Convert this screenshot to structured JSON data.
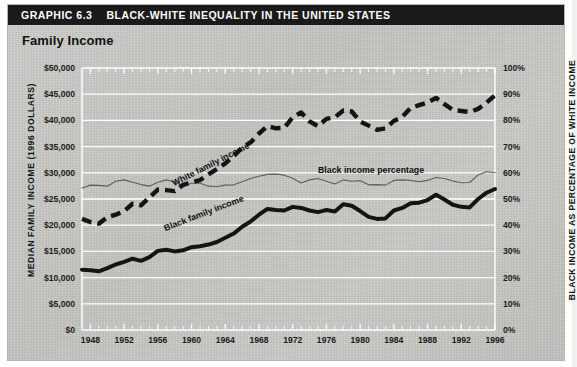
{
  "header": {
    "graphic_label": "GRAPHIC 6.3",
    "title": "BLACK-WHITE INEQUALITY IN THE UNITED STATES",
    "subtitle": "Family Income",
    "bar_color": "#1a1a1a",
    "panel_color": "#c9cac6"
  },
  "chart_data": {
    "type": "line",
    "title": "Family Income",
    "xlabel": "",
    "ylabel": "MEDIAN FAMILY INCOME (1996 DOLLARS)",
    "y2label": "BLACK INCOME AS PERCENTAGE OF WHITE INCOME",
    "xlim": [
      1947,
      1996
    ],
    "ylim": [
      0,
      50000
    ],
    "y2lim": [
      0,
      100
    ],
    "grid": true,
    "legend": "inline-labels",
    "y_ticks": [
      "$0",
      "$5,000",
      "$10,000",
      "$15,000",
      "$20,000",
      "$25,000",
      "$30,000",
      "$35,000",
      "$40,000",
      "$45,000",
      "$50,000"
    ],
    "y_tick_values": [
      0,
      5000,
      10000,
      15000,
      20000,
      25000,
      30000,
      35000,
      40000,
      45000,
      50000
    ],
    "y2_ticks": [
      "0%",
      "10%",
      "20%",
      "30%",
      "40%",
      "50%",
      "60%",
      "70%",
      "80%",
      "90%",
      "100%"
    ],
    "y2_tick_values": [
      0,
      10,
      20,
      30,
      40,
      50,
      60,
      70,
      80,
      90,
      100
    ],
    "x_ticks": [
      "1948",
      "1952",
      "1956",
      "1960",
      "1964",
      "1968",
      "1972",
      "1976",
      "1980",
      "1984",
      "1988",
      "1992",
      "1996"
    ],
    "x_tick_values": [
      1948,
      1952,
      1956,
      1960,
      1964,
      1968,
      1972,
      1976,
      1980,
      1984,
      1988,
      1992,
      1996
    ],
    "x": [
      1947,
      1948,
      1949,
      1950,
      1951,
      1952,
      1953,
      1954,
      1955,
      1956,
      1957,
      1958,
      1959,
      1960,
      1961,
      1962,
      1963,
      1964,
      1965,
      1966,
      1967,
      1968,
      1969,
      1970,
      1971,
      1972,
      1973,
      1974,
      1975,
      1976,
      1977,
      1978,
      1979,
      1980,
      1981,
      1982,
      1983,
      1984,
      1985,
      1986,
      1987,
      1988,
      1989,
      1990,
      1991,
      1992,
      1993,
      1994,
      1995,
      1996
    ],
    "series": [
      {
        "name": "White family income",
        "label": "White family income",
        "style": "dashed",
        "color": "#141414",
        "axis": "left",
        "values": [
          21200,
          20600,
          20300,
          21500,
          22000,
          22700,
          24100,
          23800,
          25300,
          26800,
          26700,
          26500,
          27700,
          28200,
          28600,
          29700,
          30700,
          31800,
          33200,
          34800,
          35800,
          37500,
          38900,
          38500,
          38600,
          40600,
          41500,
          39800,
          38900,
          40300,
          40600,
          41900,
          41700,
          39800,
          39000,
          38200,
          38500,
          39900,
          40700,
          42400,
          42900,
          43400,
          44300,
          43100,
          42000,
          41800,
          41600,
          42200,
          43400,
          44800
        ]
      },
      {
        "name": "Black family income",
        "label": "Black family income",
        "style": "solid-thick",
        "color": "#141414",
        "axis": "left",
        "values": [
          11500,
          11400,
          11200,
          11800,
          12500,
          13000,
          13600,
          13200,
          13900,
          15100,
          15300,
          15000,
          15200,
          15800,
          16000,
          16300,
          16800,
          17600,
          18400,
          19700,
          20700,
          22000,
          23100,
          22900,
          22800,
          23500,
          23300,
          22800,
          22500,
          22900,
          22600,
          24000,
          23700,
          22700,
          21600,
          21200,
          21300,
          22800,
          23300,
          24200,
          24300,
          24800,
          25800,
          24900,
          23900,
          23500,
          23400,
          25000,
          26200,
          26900
        ]
      },
      {
        "name": "Black income percentage",
        "label": "Black income percentage",
        "style": "thin",
        "color": "#5d5d5d",
        "axis": "right",
        "values": [
          54.2,
          55.3,
          55.2,
          54.9,
          56.8,
          57.3,
          56.4,
          55.5,
          54.9,
          56.4,
          57.3,
          56.6,
          54.9,
          56.0,
          56.0,
          54.9,
          54.7,
          55.3,
          55.4,
          56.6,
          57.8,
          58.7,
          59.4,
          59.5,
          59.1,
          57.9,
          56.1,
          57.3,
          57.8,
          56.8,
          55.7,
          57.3,
          56.8,
          57.0,
          55.4,
          55.5,
          55.3,
          57.1,
          57.3,
          57.1,
          56.6,
          57.1,
          58.2,
          57.8,
          56.9,
          56.2,
          56.3,
          59.2,
          60.4,
          60.0
        ]
      }
    ],
    "annotations": [
      {
        "text": "White family income",
        "x": 1958,
        "y": 29000
      },
      {
        "text": "Black family income",
        "x": 1957,
        "y": 20500
      },
      {
        "text": "Black income percentage",
        "x": 1975,
        "y": 63
      }
    ]
  }
}
